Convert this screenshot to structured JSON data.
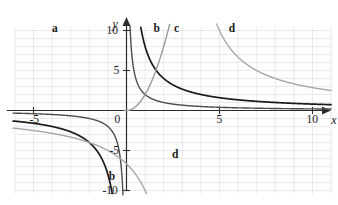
{
  "chart_data": {
    "type": "line",
    "title": "",
    "subtitle": "",
    "xlabel": "x",
    "ylabel": "y",
    "xlim": [
      -6.2,
      10.6
    ],
    "ylim": [
      -10.6,
      10.6
    ],
    "grid": true,
    "grid_step_x": 1,
    "grid_step_y": 1,
    "legend_position": "inline-curve-labels",
    "x_tick_labels": [
      "-5",
      "5",
      "10"
    ],
    "x_tick_values": [
      -5,
      5,
      10
    ],
    "y_tick_labels": [
      "10",
      "5",
      "0",
      "-5",
      "-10"
    ],
    "y_tick_values": [
      10,
      5,
      0,
      -5,
      -10
    ],
    "origin_label": "0",
    "axis_arrows": [
      "x-right",
      "y-up"
    ],
    "series": [
      {
        "name": "a",
        "label": "a",
        "color": "#4d4d4d",
        "line_width": 1.4,
        "kind": "reciprocal",
        "equation": "y = 2/x",
        "asymptote_x": 0,
        "asymptote_y": 0,
        "branches": [
          "upper-left",
          "lower-left"
        ],
        "label_x": -4.0,
        "label_y": 10.2
      },
      {
        "name": "b",
        "label": "b",
        "color": "#1a1a1a",
        "line_width": 1.7,
        "kind": "reciprocal",
        "equation": "y = 8/x",
        "asymptote_x": 0,
        "asymptote_y": 0,
        "branches": [
          "upper-right",
          "lower-left"
        ],
        "label_x": 1.45,
        "label_y": 10.2,
        "label2_x": -0.95,
        "label2_y": -8.3
      },
      {
        "name": "c",
        "label": "c",
        "color": "#9a9a9a",
        "line_width": 1.4,
        "kind": "rising",
        "equation": "y = 2 x^2 (rising branch)",
        "label_x": 2.55,
        "label_y": 10.2
      },
      {
        "name": "d",
        "label": "d",
        "color": "#a6a6a6",
        "line_width": 1.4,
        "kind": "reciprocal-shifted",
        "equation": "y = 20/(x - 3)",
        "asymptote_x": 3,
        "asymptote_y": 0,
        "branches": [
          "upper-right",
          "lower-left"
        ],
        "label_x": 5.5,
        "label_y": 10.2,
        "label2_x": 2.45,
        "label2_y": -5.6
      }
    ]
  },
  "axes": {
    "x_name": "x",
    "y_name": "y"
  },
  "ticks": {
    "x": [
      {
        "value": -5,
        "text": "-5"
      },
      {
        "value": 5,
        "text": "5"
      },
      {
        "value": 10,
        "text": "10"
      }
    ],
    "y": [
      {
        "value": 10,
        "text": "10"
      },
      {
        "value": 5,
        "text": "5"
      },
      {
        "value": 0,
        "text": "0"
      },
      {
        "value": -5,
        "text": "-5"
      },
      {
        "value": -10,
        "text": "-10"
      }
    ]
  },
  "labels": {
    "a": "a",
    "b_top": "b",
    "b_bottom": "b",
    "c": "c",
    "d_top": "d",
    "d_bottom": "d"
  },
  "colors": {
    "background": "#ffffff",
    "grid": "#e3e3e8",
    "axis": "#2b2b2b",
    "curve_a": "#4d4d4d",
    "curve_b": "#1a1a1a",
    "curve_c": "#9a9a9a",
    "curve_d": "#a6a6a6",
    "text": "#1a1a1a"
  }
}
